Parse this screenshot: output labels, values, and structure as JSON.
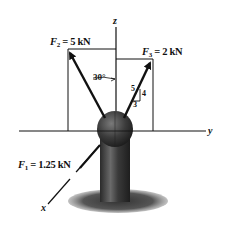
{
  "diagram": {
    "type": "3D force diagram on a post with ball joint",
    "axes": {
      "x": {
        "label": "x"
      },
      "y": {
        "label": "y"
      },
      "z": {
        "label": "z"
      }
    },
    "forces": {
      "F1": {
        "symbol": "F",
        "sub": "1",
        "eq": " = 1.25 kN"
      },
      "F2": {
        "symbol": "F",
        "sub": "2",
        "eq": " = 5 kN"
      },
      "F3": {
        "symbol": "F",
        "sub": "3",
        "eq": " = 2 kN"
      }
    },
    "angle_label": "30°",
    "slope_triangle": {
      "hyp": "5",
      "rise": "4",
      "run": "3"
    },
    "colors": {
      "ink": "#111111",
      "ball": "#3a3a3a",
      "post": "#4a4a4a",
      "shadow": "#555555",
      "background": "#ffffff"
    }
  }
}
